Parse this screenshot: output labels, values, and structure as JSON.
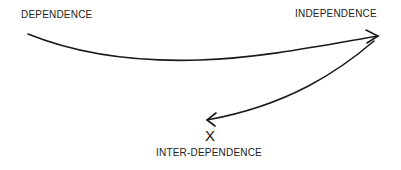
{
  "diagram": {
    "nodes": [
      {
        "id": "dependence",
        "label": "DEPENDENCE"
      },
      {
        "id": "independence",
        "label": "INDEPENDENCE"
      },
      {
        "id": "inter_dependence",
        "label": "INTER-DEPENDENCE",
        "marker": "X"
      }
    ],
    "edges": [
      {
        "from": "dependence",
        "to": "independence",
        "style": "curved-arrow"
      },
      {
        "from": "independence",
        "to": "inter_dependence",
        "style": "curved-arrow"
      }
    ],
    "colors": {
      "stroke": "#1a1a1a",
      "text": "#222222",
      "background": "#ffffff"
    }
  }
}
